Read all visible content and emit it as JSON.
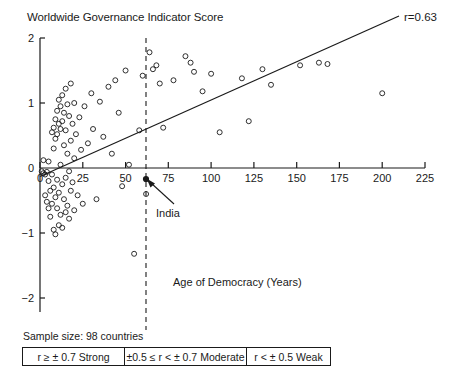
{
  "chart_data": {
    "type": "scatter",
    "title": "Worldwide Governance Indicator Score",
    "xlabel": "Age of Democracy (Years)",
    "ylabel": "Worldwide Governance Indicator Score",
    "xlim": [
      0,
      225
    ],
    "ylim": [
      -2,
      2
    ],
    "xticks": [
      0,
      25,
      50,
      75,
      100,
      125,
      150,
      175,
      200,
      225
    ],
    "yticks": [
      2,
      1,
      0,
      -1,
      -2
    ],
    "ytick_labels": [
      "2",
      "1",
      "0",
      "−1",
      "−2"
    ],
    "grid": false,
    "legend_position": "below-plot",
    "annotations": [
      {
        "text": "r=0.63",
        "position": "top-right"
      },
      {
        "text": "India",
        "x": 62,
        "y": -0.18,
        "marker": "filled"
      }
    ],
    "reference_line": {
      "type": "vertical",
      "x": 62,
      "style": "dashed",
      "label": "India"
    },
    "trendline": {
      "type": "linear",
      "x0": 0,
      "y0": -0.13,
      "x1": 210,
      "y1": 1.87,
      "r": 0.63
    },
    "series": [
      {
        "name": "countries",
        "marker": "open-circle",
        "points": [
          [
            1,
            -0.05
          ],
          [
            2,
            -0.08
          ],
          [
            2,
            0.12
          ],
          [
            3,
            -0.1
          ],
          [
            3,
            -0.42
          ],
          [
            4,
            -0.06
          ],
          [
            4,
            -0.52
          ],
          [
            5,
            0.1
          ],
          [
            5,
            -0.2
          ],
          [
            5,
            -0.62
          ],
          [
            6,
            -0.35
          ],
          [
            6,
            -0.75
          ],
          [
            7,
            0.55
          ],
          [
            7,
            -0.1
          ],
          [
            7,
            -0.55
          ],
          [
            8,
            0.62
          ],
          [
            8,
            0.3
          ],
          [
            8,
            -0.3
          ],
          [
            8,
            -0.95
          ],
          [
            9,
            0.75
          ],
          [
            9,
            0.45
          ],
          [
            9,
            -0.45
          ],
          [
            9,
            -1.02
          ],
          [
            10,
            0.88
          ],
          [
            10,
            0.52
          ],
          [
            10,
            -0.18
          ],
          [
            10,
            -0.62
          ],
          [
            11,
            1.05
          ],
          [
            11,
            0.68
          ],
          [
            11,
            -0.38
          ],
          [
            11,
            -0.88
          ],
          [
            12,
            0.95
          ],
          [
            12,
            0.6
          ],
          [
            12,
            0.05
          ],
          [
            12,
            -0.72
          ],
          [
            13,
            1.12
          ],
          [
            13,
            0.72
          ],
          [
            13,
            -0.25
          ],
          [
            13,
            -0.92
          ],
          [
            14,
            0.85
          ],
          [
            14,
            0.35
          ],
          [
            14,
            -0.48
          ],
          [
            15,
            1.22
          ],
          [
            15,
            0.58
          ],
          [
            15,
            -0.15
          ],
          [
            15,
            -0.68
          ],
          [
            16,
            0.98
          ],
          [
            16,
            0.22
          ],
          [
            16,
            -0.58
          ],
          [
            17,
            0.8
          ],
          [
            17,
            -0.05
          ],
          [
            17,
            -0.78
          ],
          [
            18,
            1.3
          ],
          [
            18,
            0.42
          ],
          [
            18,
            -0.35
          ],
          [
            19,
            0.68
          ],
          [
            19,
            -0.22
          ],
          [
            20,
            1.0
          ],
          [
            20,
            0.15
          ],
          [
            20,
            -0.65
          ],
          [
            21,
            0.52
          ],
          [
            22,
            -0.42
          ],
          [
            23,
            0.78
          ],
          [
            24,
            0.28
          ],
          [
            25,
            -0.55
          ],
          [
            26,
            0.95
          ],
          [
            28,
            0.38
          ],
          [
            30,
            1.15
          ],
          [
            31,
            0.6
          ],
          [
            33,
            -0.48
          ],
          [
            35,
            1.02
          ],
          [
            37,
            0.48
          ],
          [
            40,
            1.25
          ],
          [
            42,
            0.22
          ],
          [
            44,
            1.35
          ],
          [
            46,
            0.85
          ],
          [
            48,
            -0.28
          ],
          [
            50,
            1.5
          ],
          [
            52,
            0.05
          ],
          [
            55,
            -1.32
          ],
          [
            58,
            0.58
          ],
          [
            60,
            1.42
          ],
          [
            62,
            -0.4
          ],
          [
            64,
            1.78
          ],
          [
            66,
            1.52
          ],
          [
            68,
            1.58
          ],
          [
            70,
            1.3
          ],
          [
            72,
            0.62
          ],
          [
            78,
            1.35
          ],
          [
            85,
            1.72
          ],
          [
            88,
            1.62
          ],
          [
            90,
            1.48
          ],
          [
            95,
            1.18
          ],
          [
            100,
            1.45
          ],
          [
            105,
            0.55
          ],
          [
            118,
            1.38
          ],
          [
            122,
            0.72
          ],
          [
            130,
            1.52
          ],
          [
            135,
            1.28
          ],
          [
            152,
            1.58
          ],
          [
            163,
            1.62
          ],
          [
            168,
            1.6
          ],
          [
            200,
            1.15
          ]
        ]
      }
    ]
  },
  "footer": {
    "sample_size": "Sample size: 98 countries",
    "legend_cells": [
      "r ≥ ± 0.7 Strong",
      "±0.5 ≤ r < ± 0.7 Moderate",
      "r < ± 0.5 Weak"
    ]
  }
}
